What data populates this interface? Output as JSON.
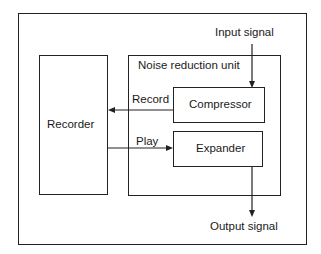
{
  "diagram": {
    "input_label": "Input signal",
    "output_label": "Output signal",
    "recorder_label": "Recorder",
    "unit_label": "Noise reduction unit",
    "compressor_label": "Compressor",
    "expander_label": "Expander",
    "record_label": "Record",
    "play_label": "Play"
  }
}
